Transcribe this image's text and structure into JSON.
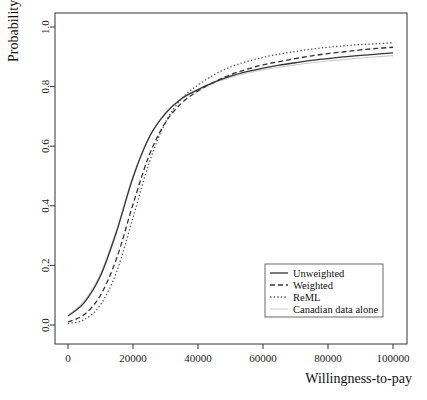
{
  "chart_data": {
    "type": "line",
    "title": "",
    "xlabel": "Willingness-to-pay",
    "ylabel": "Probability",
    "xlim": [
      0,
      100000
    ],
    "ylim": [
      0.0,
      1.0
    ],
    "grid": false,
    "legend_position": "bottom-right",
    "x_ticks": [
      0,
      20000,
      40000,
      60000,
      80000,
      100000
    ],
    "x_tick_labels": [
      "0",
      "20000",
      "40000",
      "60000",
      "80000",
      "100000"
    ],
    "y_ticks": [
      0.0,
      0.2,
      0.4,
      0.6,
      0.8,
      1.0
    ],
    "y_tick_labels": [
      "0.0",
      "0.2",
      "0.4",
      "0.6",
      "0.8",
      "1.0"
    ],
    "x": [
      0,
      5000,
      10000,
      15000,
      20000,
      25000,
      30000,
      35000,
      40000,
      45000,
      50000,
      55000,
      60000,
      65000,
      70000,
      75000,
      80000,
      85000,
      90000,
      95000,
      100000
    ],
    "series": [
      {
        "name": "Unweighted",
        "style": "solid",
        "color": "#333333",
        "width": 1.3,
        "values": [
          0.03,
          0.075,
          0.165,
          0.315,
          0.495,
          0.63,
          0.71,
          0.76,
          0.79,
          0.815,
          0.835,
          0.85,
          0.862,
          0.872,
          0.88,
          0.888,
          0.894,
          0.9,
          0.905,
          0.909,
          0.913
        ]
      },
      {
        "name": "Weighted",
        "style": "dashed",
        "color": "#333333",
        "width": 1.3,
        "values": [
          0.01,
          0.035,
          0.1,
          0.225,
          0.405,
          0.57,
          0.68,
          0.745,
          0.785,
          0.815,
          0.84,
          0.858,
          0.873,
          0.884,
          0.894,
          0.903,
          0.911,
          0.917,
          0.923,
          0.928,
          0.932
        ]
      },
      {
        "name": "ReML",
        "style": "dotted",
        "color": "#555555",
        "width": 1.3,
        "values": [
          0.005,
          0.018,
          0.068,
          0.18,
          0.36,
          0.545,
          0.68,
          0.76,
          0.805,
          0.84,
          0.866,
          0.884,
          0.898,
          0.909,
          0.918,
          0.926,
          0.932,
          0.937,
          0.941,
          0.944,
          0.947
        ]
      },
      {
        "name": "Canadian data alone",
        "style": "solid-light",
        "color": "#cccccc",
        "width": 1.1,
        "values": [
          0.032,
          0.08,
          0.172,
          0.322,
          0.5,
          0.632,
          0.712,
          0.76,
          0.79,
          0.813,
          0.831,
          0.845,
          0.856,
          0.865,
          0.873,
          0.88,
          0.886,
          0.891,
          0.896,
          0.9,
          0.904
        ]
      }
    ]
  },
  "legend": {
    "items": [
      {
        "label": "Unweighted"
      },
      {
        "label": "Weighted"
      },
      {
        "label": "ReML"
      },
      {
        "label": "Canadian data alone"
      }
    ]
  },
  "axes": {
    "x_title": "Willingness-to-pay",
    "y_title": "Probability"
  }
}
